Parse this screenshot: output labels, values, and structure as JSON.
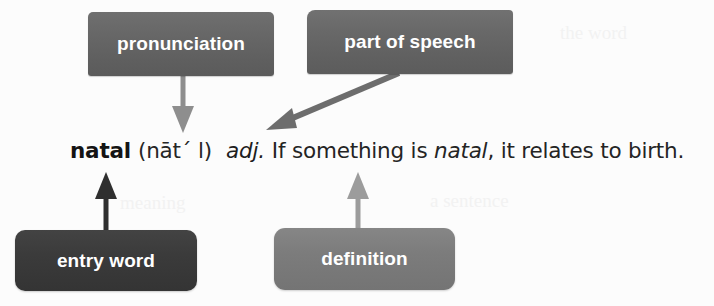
{
  "diagram": {
    "background_color": "#fcfcfc",
    "callouts": [
      {
        "id": "pronunciation",
        "label": "pronunciation",
        "fill": "#666666",
        "text_color": "#ffffff"
      },
      {
        "id": "part-of-speech",
        "label": "part of speech",
        "fill": "#666666",
        "text_color": "#ffffff"
      },
      {
        "id": "entry-word",
        "label": "entry word",
        "fill": "#3b3b3b",
        "text_color": "#ffffff"
      },
      {
        "id": "definition",
        "label": "definition",
        "fill": "#7c7c7c",
        "text_color": "#ffffff"
      }
    ],
    "entry": {
      "headword": "natal",
      "pronunciation": "(nāt´ l)",
      "part_of_speech": "adj.",
      "definition_before": "If something is ",
      "definition_italic": "natal",
      "definition_after": ", it relates to birth."
    },
    "arrows": [
      {
        "id": "pronunciation-to-entry",
        "from": "pronunciation",
        "to": "pronunciation-text",
        "direction": "down",
        "color": "#8c8c8c"
      },
      {
        "id": "part-of-speech-to-entry",
        "from": "part-of-speech",
        "to": "adj-text",
        "direction": "down-left",
        "color": "#6a6a6a"
      },
      {
        "id": "entry-word-to-headword",
        "from": "entry-word",
        "to": "headword-text",
        "direction": "up",
        "color": "#303030"
      },
      {
        "id": "definition-to-definition-text",
        "from": "definition",
        "to": "definition-text",
        "direction": "up",
        "color": "#9a9a9a"
      }
    ],
    "artifacts": [
      {
        "text": "the word",
        "x": 560,
        "y": 28
      },
      {
        "text": "a sentence",
        "x": 470,
        "y": 196
      },
      {
        "text": "meaning",
        "x": 120,
        "y": 198
      }
    ]
  }
}
